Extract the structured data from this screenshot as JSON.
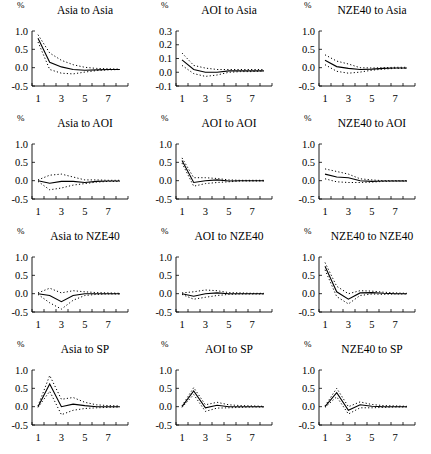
{
  "figure": {
    "unit_label": "%",
    "x_tick_labels": [
      "1",
      "3",
      "5",
      "7"
    ]
  },
  "chart_data": [
    {
      "type": "line",
      "title": "Asia to Asia",
      "ylim": [
        -0.5,
        1.0
      ],
      "yticks": [
        "1.0",
        "0.5",
        "0.0",
        "-0.5"
      ],
      "x": [
        1,
        2,
        3,
        4,
        5,
        6,
        7,
        8
      ],
      "series": [
        {
          "name": "response",
          "style": "solid",
          "values": [
            0.8,
            0.15,
            0.02,
            -0.05,
            -0.07,
            -0.06,
            -0.05,
            -0.05
          ]
        },
        {
          "name": "upper",
          "style": "dotted",
          "values": [
            0.9,
            0.4,
            0.2,
            0.08,
            0.01,
            -0.02,
            -0.03,
            -0.04
          ]
        },
        {
          "name": "lower",
          "style": "dotted",
          "values": [
            0.7,
            -0.05,
            -0.15,
            -0.17,
            -0.12,
            -0.08,
            -0.06,
            -0.05
          ]
        }
      ]
    },
    {
      "type": "line",
      "title": "AOI to Asia",
      "ylim": [
        -0.1,
        0.3
      ],
      "yticks": [
        "0.3",
        "0.2",
        "0.1",
        "0.0",
        "-0.1"
      ],
      "x": [
        1,
        2,
        3,
        4,
        5,
        6,
        7,
        8
      ],
      "series": [
        {
          "name": "response",
          "style": "solid",
          "values": [
            0.09,
            0.02,
            0.0,
            0.0,
            0.01,
            0.01,
            0.01,
            0.01
          ]
        },
        {
          "name": "upper",
          "style": "dotted",
          "values": [
            0.14,
            0.05,
            0.03,
            0.02,
            0.02,
            0.02,
            0.02,
            0.02
          ]
        },
        {
          "name": "lower",
          "style": "dotted",
          "values": [
            0.05,
            -0.01,
            -0.03,
            -0.02,
            0.0,
            0.005,
            0.005,
            0.01
          ]
        }
      ]
    },
    {
      "type": "line",
      "title": "NZE40 to Asia",
      "ylim": [
        -0.5,
        1.0
      ],
      "yticks": [
        "1.0",
        "0.5",
        "0.0",
        "-0.5"
      ],
      "x": [
        1,
        2,
        3,
        4,
        5,
        6,
        7,
        8
      ],
      "series": [
        {
          "name": "response",
          "style": "solid",
          "values": [
            0.2,
            0.03,
            -0.02,
            -0.05,
            -0.04,
            -0.02,
            -0.01,
            -0.01
          ]
        },
        {
          "name": "upper",
          "style": "dotted",
          "values": [
            0.35,
            0.18,
            0.1,
            0.0,
            -0.01,
            0.0,
            0.01,
            0.01
          ]
        },
        {
          "name": "lower",
          "style": "dotted",
          "values": [
            0.08,
            -0.1,
            -0.15,
            -0.12,
            -0.07,
            -0.04,
            -0.02,
            -0.02
          ]
        }
      ]
    },
    {
      "type": "line",
      "title": "Asia to AOI",
      "ylim": [
        -0.5,
        1.0
      ],
      "yticks": [
        "1.0",
        "0.5",
        "0.0",
        "-0.5"
      ],
      "x": [
        1,
        2,
        3,
        4,
        5,
        6,
        7,
        8
      ],
      "series": [
        {
          "name": "response",
          "style": "solid",
          "values": [
            0.0,
            -0.07,
            -0.02,
            -0.02,
            -0.05,
            -0.02,
            -0.01,
            -0.01
          ]
        },
        {
          "name": "upper",
          "style": "dotted",
          "values": [
            0.02,
            0.15,
            0.18,
            0.1,
            0.02,
            0.02,
            0.01,
            0.01
          ]
        },
        {
          "name": "lower",
          "style": "dotted",
          "values": [
            -0.02,
            -0.25,
            -0.2,
            -0.12,
            -0.08,
            -0.04,
            -0.02,
            -0.02
          ]
        }
      ]
    },
    {
      "type": "line",
      "title": "AOI to AOI",
      "ylim": [
        -0.5,
        1.0
      ],
      "yticks": [
        "1.0",
        "0.5",
        "0.0",
        "-0.5"
      ],
      "x": [
        1,
        2,
        3,
        4,
        5,
        6,
        7,
        8
      ],
      "series": [
        {
          "name": "response",
          "style": "solid",
          "values": [
            0.55,
            -0.05,
            0.0,
            0.02,
            -0.01,
            0.0,
            0.0,
            0.0
          ]
        },
        {
          "name": "upper",
          "style": "dotted",
          "values": [
            0.62,
            0.08,
            0.08,
            0.06,
            0.02,
            0.01,
            0.01,
            0.01
          ]
        },
        {
          "name": "lower",
          "style": "dotted",
          "values": [
            0.48,
            -0.15,
            -0.08,
            -0.05,
            -0.03,
            -0.01,
            -0.01,
            -0.01
          ]
        }
      ]
    },
    {
      "type": "line",
      "title": "NZE40 to AOI",
      "ylim": [
        -0.5,
        1.0
      ],
      "yticks": [
        "1.0",
        "0.5",
        "0.0",
        "-0.5"
      ],
      "x": [
        1,
        2,
        3,
        4,
        5,
        6,
        7,
        8
      ],
      "series": [
        {
          "name": "response",
          "style": "solid",
          "values": [
            0.18,
            0.1,
            0.08,
            0.0,
            -0.02,
            -0.01,
            -0.01,
            -0.01
          ]
        },
        {
          "name": "upper",
          "style": "dotted",
          "values": [
            0.32,
            0.25,
            0.18,
            0.05,
            0.02,
            0.0,
            0.0,
            0.0
          ]
        },
        {
          "name": "lower",
          "style": "dotted",
          "values": [
            0.05,
            -0.03,
            -0.05,
            -0.05,
            -0.04,
            -0.02,
            -0.01,
            -0.01
          ]
        }
      ]
    },
    {
      "type": "line",
      "title": "Asia to NZE40",
      "ylim": [
        -0.5,
        1.0
      ],
      "yticks": [
        "1.0",
        "0.5",
        "0.0",
        "-0.5"
      ],
      "x": [
        1,
        2,
        3,
        4,
        5,
        6,
        7,
        8
      ],
      "series": [
        {
          "name": "response",
          "style": "solid",
          "values": [
            0.0,
            -0.05,
            -0.22,
            -0.05,
            0.0,
            0.0,
            0.0,
            0.0
          ]
        },
        {
          "name": "upper",
          "style": "dotted",
          "values": [
            0.02,
            0.15,
            0.02,
            0.08,
            0.05,
            0.03,
            0.02,
            0.01
          ]
        },
        {
          "name": "lower",
          "style": "dotted",
          "values": [
            -0.02,
            -0.25,
            -0.42,
            -0.18,
            -0.05,
            -0.02,
            -0.01,
            -0.01
          ]
        }
      ]
    },
    {
      "type": "line",
      "title": "AOI to NZE40",
      "ylim": [
        -0.5,
        1.0
      ],
      "yticks": [
        "1.0",
        "0.5",
        "0.0",
        "-0.5"
      ],
      "x": [
        1,
        2,
        3,
        4,
        5,
        6,
        7,
        8
      ],
      "series": [
        {
          "name": "response",
          "style": "solid",
          "values": [
            0.0,
            -0.07,
            0.0,
            0.02,
            0.0,
            0.0,
            0.0,
            0.0
          ]
        },
        {
          "name": "upper",
          "style": "dotted",
          "values": [
            0.02,
            0.05,
            0.1,
            0.08,
            0.03,
            0.02,
            0.01,
            0.01
          ]
        },
        {
          "name": "lower",
          "style": "dotted",
          "values": [
            -0.02,
            -0.15,
            -0.1,
            -0.05,
            -0.02,
            -0.01,
            -0.01,
            -0.01
          ]
        }
      ]
    },
    {
      "type": "line",
      "title": "NZE40 to NZE40",
      "ylim": [
        -0.5,
        1.0
      ],
      "yticks": [
        "1.0",
        "0.5",
        "0.0",
        "-0.5"
      ],
      "x": [
        1,
        2,
        3,
        4,
        5,
        6,
        7,
        8
      ],
      "series": [
        {
          "name": "response",
          "style": "solid",
          "values": [
            0.75,
            0.05,
            -0.15,
            0.02,
            0.03,
            0.01,
            0.0,
            0.0
          ]
        },
        {
          "name": "upper",
          "style": "dotted",
          "values": [
            0.85,
            0.2,
            0.0,
            0.08,
            0.07,
            0.04,
            0.02,
            0.01
          ]
        },
        {
          "name": "lower",
          "style": "dotted",
          "values": [
            0.65,
            -0.08,
            -0.28,
            -0.05,
            -0.01,
            -0.02,
            -0.01,
            -0.01
          ]
        }
      ]
    },
    {
      "type": "line",
      "title": "Asia to SP",
      "ylim": [
        -0.5,
        1.0
      ],
      "yticks": [
        "1.0",
        "0.5",
        "0.0",
        "-0.5"
      ],
      "x": [
        1,
        2,
        3,
        4,
        5,
        6,
        7,
        8
      ],
      "series": [
        {
          "name": "response",
          "style": "solid",
          "values": [
            0.0,
            0.62,
            0.0,
            0.07,
            0.03,
            0.0,
            0.0,
            0.0
          ]
        },
        {
          "name": "upper",
          "style": "dotted",
          "values": [
            0.02,
            0.85,
            0.2,
            0.25,
            0.12,
            0.05,
            0.03,
            0.02
          ]
        },
        {
          "name": "lower",
          "style": "dotted",
          "values": [
            -0.02,
            0.42,
            -0.22,
            -0.1,
            -0.05,
            -0.03,
            -0.02,
            -0.01
          ]
        }
      ]
    },
    {
      "type": "line",
      "title": "AOI to SP",
      "ylim": [
        -0.5,
        1.0
      ],
      "yticks": [
        "1.0",
        "0.5",
        "0.0",
        "-0.5"
      ],
      "x": [
        1,
        2,
        3,
        4,
        5,
        6,
        7,
        8
      ],
      "series": [
        {
          "name": "response",
          "style": "solid",
          "values": [
            0.0,
            0.43,
            -0.03,
            0.04,
            0.0,
            0.0,
            0.0,
            0.0
          ]
        },
        {
          "name": "upper",
          "style": "dotted",
          "values": [
            0.02,
            0.52,
            0.05,
            0.12,
            0.05,
            0.03,
            0.02,
            0.01
          ]
        },
        {
          "name": "lower",
          "style": "dotted",
          "values": [
            -0.02,
            0.33,
            -0.13,
            -0.04,
            -0.03,
            -0.02,
            -0.01,
            -0.01
          ]
        }
      ]
    },
    {
      "type": "line",
      "title": "NZE40 to SP",
      "ylim": [
        -0.5,
        1.0
      ],
      "yticks": [
        "1.0",
        "0.5",
        "0.0",
        "-0.5"
      ],
      "x": [
        1,
        2,
        3,
        4,
        5,
        6,
        7,
        8
      ],
      "series": [
        {
          "name": "response",
          "style": "solid",
          "values": [
            0.0,
            0.38,
            -0.1,
            0.05,
            0.01,
            0.0,
            0.0,
            0.0
          ]
        },
        {
          "name": "upper",
          "style": "dotted",
          "values": [
            0.02,
            0.5,
            0.0,
            0.13,
            0.06,
            0.03,
            0.02,
            0.01
          ]
        },
        {
          "name": "lower",
          "style": "dotted",
          "values": [
            -0.02,
            0.27,
            -0.2,
            -0.03,
            -0.03,
            -0.02,
            -0.01,
            -0.01
          ]
        }
      ]
    }
  ]
}
